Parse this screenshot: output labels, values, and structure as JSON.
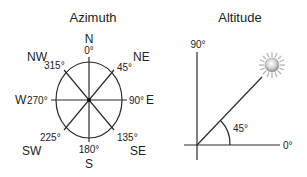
{
  "azimuth": {
    "title": "Azimuth",
    "directions": {
      "n": "N",
      "ne": "NE",
      "e": "E",
      "se": "SE",
      "s": "S",
      "sw": "SW",
      "w": "W",
      "nw": "NW"
    },
    "degrees": {
      "n": "0°",
      "ne": "45°",
      "e": "90°",
      "se": "135°",
      "s": "180°",
      "sw": "225°",
      "w": "270°",
      "nw": "315°"
    }
  },
  "altitude": {
    "title": "Altitude",
    "vertical_label": "90°",
    "horizontal_label": "0°",
    "angle_label": "45°",
    "icon": "sun-icon"
  },
  "colors": {
    "stroke": "#2a2a2a",
    "text": "#222222",
    "sun_core": "#9a9a9a",
    "sun_rays": "#b0b0b0"
  }
}
